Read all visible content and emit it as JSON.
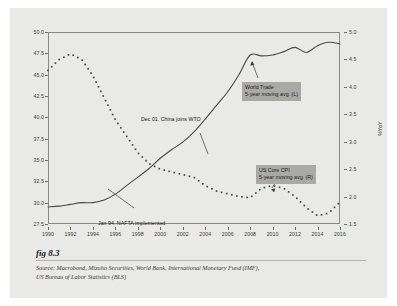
{
  "figure": {
    "label": "fig 8.3",
    "source_line1": "Source:  Macrobond, Mizuho Securities, World Bank, International Monetary Fund (IMF),",
    "source_line2": "US Bureau of Labor Statistics (BLS)"
  },
  "annotations": {
    "wto": "Dec 01. China joins WTO",
    "nafta": "Jan 94. NAFTA implemented",
    "trade_line1": "World Trade",
    "trade_line2": "5-year moving avg. (L)",
    "cpi_line1": "US Core CPI",
    "cpi_line2": "5-year moving avg. (R)"
  },
  "colors": {
    "background": "#e9e9e7",
    "frame": "#8a8a88",
    "series_trade": "#4a4a48",
    "series_cpi": "#4a4a48",
    "callout_bg": "#a9a9a6"
  },
  "chart_data": {
    "type": "line",
    "title": "",
    "xlabel": "",
    "ylabel": "% of World GDP",
    "ylabel_right": "%YoY",
    "grid": false,
    "legend_position": "inside-annotations",
    "x": [
      1990,
      1991,
      1992,
      1993,
      1994,
      1995,
      1996,
      1997,
      1998,
      1999,
      2000,
      2001,
      2002,
      2003,
      2004,
      2005,
      2006,
      2007,
      2008,
      2009,
      2010,
      2011,
      2012,
      2013,
      2014,
      2015,
      2016
    ],
    "xlim": [
      1990,
      2016
    ],
    "xticks": [
      1990,
      1992,
      1994,
      1996,
      1998,
      2000,
      2002,
      2004,
      2006,
      2008,
      2010,
      2012,
      2014,
      2016
    ],
    "ylim": [
      27.5,
      50.0
    ],
    "yticks": [
      27.5,
      30.0,
      32.5,
      35.0,
      37.5,
      40.0,
      42.5,
      45.0,
      47.5,
      50.0
    ],
    "ylim_right": [
      1.5,
      5.0
    ],
    "yticks_right": [
      1.5,
      2.0,
      2.5,
      3.0,
      3.5,
      4.0,
      4.5,
      5.0
    ],
    "series": [
      {
        "name": "World Trade 5-year moving avg. (L)",
        "axis": "left",
        "style": "solid",
        "units": "% of World GDP",
        "values": [
          29.5,
          29.6,
          29.8,
          30.0,
          30.0,
          30.3,
          31.0,
          32.0,
          33.0,
          34.0,
          35.2,
          36.2,
          37.1,
          38.3,
          39.8,
          41.4,
          43.0,
          45.0,
          47.3,
          47.2,
          47.3,
          47.7,
          48.2,
          47.6,
          48.4,
          48.8,
          48.6
        ]
      },
      {
        "name": "US Core CPI 5-year moving avg. (R)",
        "axis": "right",
        "style": "dotted",
        "units": "%YoY",
        "values": [
          4.3,
          4.5,
          4.6,
          4.5,
          4.2,
          3.8,
          3.4,
          3.1,
          2.8,
          2.6,
          2.5,
          2.45,
          2.4,
          2.35,
          2.2,
          2.1,
          2.05,
          2.0,
          1.98,
          2.15,
          2.2,
          2.15,
          2.0,
          1.8,
          1.65,
          1.7,
          1.9
        ]
      }
    ],
    "event_markers": [
      {
        "label": "Jan 94. NAFTA implemented",
        "x": 1994,
        "series": "World Trade 5-year moving avg. (L)",
        "y": 30.0
      },
      {
        "label": "Dec 01. China joins WTO",
        "x": 2001,
        "series": "World Trade 5-year moving avg. (L)",
        "y": 36.2
      }
    ]
  }
}
